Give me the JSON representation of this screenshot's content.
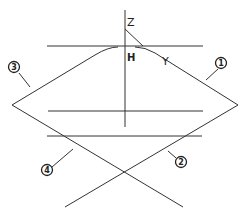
{
  "diagram": {
    "type": "geometric-line-diagram",
    "stroke_color": "#333333",
    "background": "#ffffff",
    "axis_labels": {
      "z": "Z",
      "y": "Y",
      "origin": "H"
    },
    "callouts": [
      {
        "id": "1",
        "label": "1",
        "target": "right upper diagonal"
      },
      {
        "id": "2",
        "label": "2",
        "target": "right lower diagonal"
      },
      {
        "id": "3",
        "label": "3",
        "target": "left upper curve"
      },
      {
        "id": "4",
        "label": "4",
        "target": "left lower diagonal"
      }
    ],
    "lines": {
      "vertical_axis": {
        "x": 125,
        "y1": 10,
        "y2": 127
      },
      "top_horizontal": {
        "y": 46,
        "x1": 47,
        "x2": 203
      },
      "middle_horizontal": {
        "y": 111,
        "x1": 48,
        "x2": 203
      },
      "lower_horizontal": {
        "y": 136,
        "x1": 47,
        "x2": 202
      }
    }
  }
}
